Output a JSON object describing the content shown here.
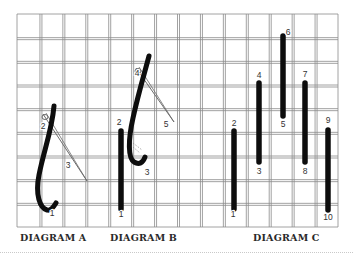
{
  "figure": {
    "type": "embroidery stitch instruction diagram",
    "colors": {
      "grid": "#8a8a8a",
      "thread": "#0d0d0d",
      "needle": "#6b6b6b",
      "background": "#ffffff",
      "caption": "#2a2a2a"
    },
    "grid": {
      "left": 17,
      "top": 14,
      "right": 338,
      "bottom": 227,
      "columns": 14,
      "rows": 9,
      "double_line_gap": 2
    }
  },
  "diagrams": [
    {
      "caption": "DIAGRAM A",
      "point_labels": [
        {
          "text": "2",
          "x": 43,
          "y": 129
        },
        {
          "text": "3",
          "x": 68,
          "y": 168
        },
        {
          "text": "1",
          "x": 52,
          "y": 216
        }
      ]
    },
    {
      "caption": "DIAGRAM B",
      "point_labels": [
        {
          "text": "4",
          "x": 137,
          "y": 76
        },
        {
          "text": "5",
          "x": 166,
          "y": 127
        },
        {
          "text": "2",
          "x": 119,
          "y": 125
        },
        {
          "text": "3",
          "x": 147,
          "y": 175
        },
        {
          "text": "1",
          "x": 121,
          "y": 217
        }
      ]
    },
    {
      "caption": "DIAGRAM C",
      "point_labels": [
        {
          "text": "2",
          "x": 234,
          "y": 126
        },
        {
          "text": "1",
          "x": 233,
          "y": 217
        },
        {
          "text": "4",
          "x": 259,
          "y": 78
        },
        {
          "text": "3",
          "x": 259,
          "y": 174
        },
        {
          "text": "6",
          "x": 288,
          "y": 35
        },
        {
          "text": "5",
          "x": 283,
          "y": 127
        },
        {
          "text": "7",
          "x": 305,
          "y": 77
        },
        {
          "text": "8",
          "x": 305,
          "y": 174
        },
        {
          "text": "9",
          "x": 328,
          "y": 123
        },
        {
          "text": "10",
          "x": 328,
          "y": 220
        }
      ]
    }
  ]
}
